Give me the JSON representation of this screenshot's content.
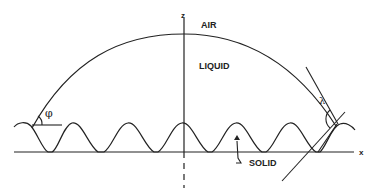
{
  "diagram": {
    "labels": {
      "z_axis": "z",
      "x_axis": "x",
      "air": "AIR",
      "liquid": "LIQUID",
      "solid": "SOLID",
      "phi": "φ",
      "lambda": "λ"
    },
    "colors": {
      "line": "#222222",
      "background": "#ffffff"
    }
  }
}
